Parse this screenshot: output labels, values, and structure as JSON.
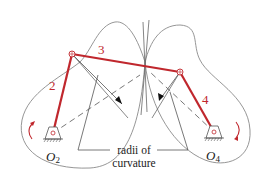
{
  "figure": {
    "type": "four-bar linkage coupler curve diagram",
    "colors": {
      "link": "#c0272d",
      "curve": "#8a8a8a",
      "construction": "#555555",
      "text": "#222222",
      "rotation_arrow": "#c0272d"
    },
    "links": [
      {
        "id": "2",
        "label": "2"
      },
      {
        "id": "3",
        "label": "3"
      },
      {
        "id": "4",
        "label": "4"
      }
    ],
    "grounds": [
      {
        "id": "O2",
        "label_main": "O",
        "label_sub": "2"
      },
      {
        "id": "O4",
        "label_main": "O",
        "label_sub": "4"
      }
    ],
    "callout": {
      "line1": "radii of",
      "line2": "curvature"
    }
  }
}
